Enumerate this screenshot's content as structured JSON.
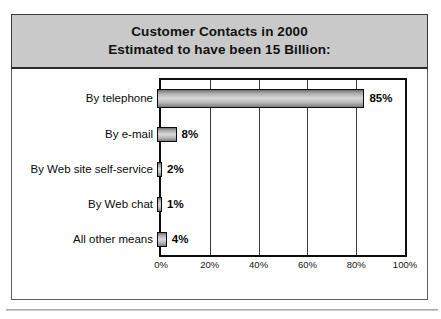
{
  "title": {
    "line1": "Customer Contacts in 2000",
    "line2": "Estimated to have been 15 Billion:"
  },
  "colors": {
    "title_band_bg": "#c9c9c9",
    "frame": "#5d5d5d",
    "plot_border": "#0d0d0d",
    "bar_fill_light": "#d8d8d8",
    "bar_fill_dark": "#6e6e6e",
    "text": "#0a0a0a"
  },
  "chart_data": {
    "type": "bar",
    "orientation": "horizontal",
    "title": "Customer Contacts in 2000 Estimated to have been 15 Billion:",
    "xlabel": "",
    "ylabel": "",
    "xlim": [
      0,
      100
    ],
    "xticks": [
      "0%",
      "20%",
      "40%",
      "60%",
      "80%",
      "100%"
    ],
    "xtick_values": [
      0,
      20,
      40,
      60,
      80,
      100
    ],
    "grid": true,
    "legend": false,
    "categories": [
      "By telephone",
      "By e-mail",
      "By Web site self-service",
      "By Web chat",
      "All other means"
    ],
    "values": [
      85,
      8,
      2,
      1,
      4
    ],
    "data_labels": [
      "85%",
      "8%",
      "2%",
      "1%",
      "4%"
    ]
  }
}
